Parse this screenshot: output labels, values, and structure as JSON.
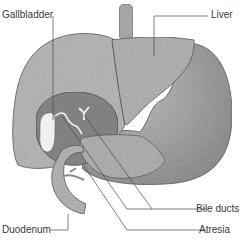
{
  "diagram": {
    "labels": {
      "gallbladder": "Gallbladder",
      "liver": "Liver",
      "bile_ducts": "Bile ducts",
      "atresia": "Atresia",
      "duodenum": "Duodenum"
    },
    "colors": {
      "organ_fill": "#b4b4b4",
      "organ_light": "#c4c4c4",
      "organ_dark": "#8e8e8e",
      "gallbladder_fill": "#efefef",
      "outline": "#5a5a5a",
      "leader_line": "#4a4a4a",
      "text": "#3a3a3a"
    }
  }
}
